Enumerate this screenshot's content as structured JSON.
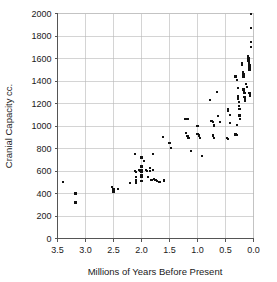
{
  "chart_data": {
    "type": "scatter",
    "title": "",
    "xlabel": "Millions of Years Before Present",
    "ylabel": "Cranial Capacity cc.",
    "xlim": [
      3.5,
      0.0
    ],
    "ylim": [
      0,
      2000
    ],
    "x_reversed": true,
    "grid": true,
    "legend": null,
    "xticks": [
      "3.5",
      "3.0",
      "2.5",
      "2.0",
      "1.5",
      "1.0",
      "0.5",
      "0.0"
    ],
    "xtick_values": [
      3.5,
      3.0,
      2.5,
      2.0,
      1.5,
      1.0,
      0.5,
      0.0
    ],
    "yticks": [
      "0",
      "200",
      "400",
      "600",
      "800",
      "1000",
      "1200",
      "1400",
      "1600",
      "1800",
      "2000"
    ],
    "ytick_values": [
      0,
      200,
      400,
      600,
      800,
      1000,
      1200,
      1400,
      1600,
      1800,
      2000
    ],
    "marker": "square",
    "marker_color": "#111111",
    "marker_size_px": 2.2,
    "points": [
      [
        3.4,
        500
      ],
      [
        3.18,
        400
      ],
      [
        3.18,
        320
      ],
      [
        2.52,
        460
      ],
      [
        2.5,
        435
      ],
      [
        2.5,
        415
      ],
      [
        2.42,
        440
      ],
      [
        2.2,
        495
      ],
      [
        2.12,
        750
      ],
      [
        2.12,
        600
      ],
      [
        2.1,
        590
      ],
      [
        2.1,
        545
      ],
      [
        2.1,
        520
      ],
      [
        2.1,
        505
      ],
      [
        2.1,
        490
      ],
      [
        2.05,
        610
      ],
      [
        2.02,
        600
      ],
      [
        2.0,
        720
      ],
      [
        2.0,
        640
      ],
      [
        2.0,
        605
      ],
      [
        2.0,
        595
      ],
      [
        2.0,
        560
      ],
      [
        2.0,
        545
      ],
      [
        2.0,
        510
      ],
      [
        1.95,
        690
      ],
      [
        1.92,
        610
      ],
      [
        1.9,
        600
      ],
      [
        1.88,
        550
      ],
      [
        1.85,
        630
      ],
      [
        1.85,
        600
      ],
      [
        1.82,
        520
      ],
      [
        1.8,
        750
      ],
      [
        1.8,
        610
      ],
      [
        1.78,
        530
      ],
      [
        1.75,
        520
      ],
      [
        1.72,
        510
      ],
      [
        1.68,
        505
      ],
      [
        1.62,
        900
      ],
      [
        1.6,
        515
      ],
      [
        1.5,
        850
      ],
      [
        1.48,
        805
      ],
      [
        1.22,
        1065
      ],
      [
        1.18,
        1060
      ],
      [
        1.2,
        940
      ],
      [
        1.18,
        910
      ],
      [
        1.16,
        895
      ],
      [
        1.15,
        890
      ],
      [
        1.12,
        780
      ],
      [
        1.0,
        1000
      ],
      [
        1.0,
        930
      ],
      [
        0.98,
        920
      ],
      [
        0.97,
        915
      ],
      [
        0.95,
        890
      ],
      [
        0.92,
        735
      ],
      [
        0.78,
        1230
      ],
      [
        0.75,
        1045
      ],
      [
        0.72,
        1035
      ],
      [
        0.7,
        1010
      ],
      [
        0.7,
        1000
      ],
      [
        0.72,
        915
      ],
      [
        0.7,
        890
      ],
      [
        0.65,
        1305
      ],
      [
        0.63,
        1090
      ],
      [
        0.6,
        1035
      ],
      [
        0.45,
        1150
      ],
      [
        0.45,
        1130
      ],
      [
        0.42,
        1100
      ],
      [
        0.42,
        1030
      ],
      [
        0.48,
        890
      ],
      [
        0.45,
        885
      ],
      [
        0.32,
        1440
      ],
      [
        0.3,
        1410
      ],
      [
        0.28,
        1340
      ],
      [
        0.28,
        1270
      ],
      [
        0.28,
        1250
      ],
      [
        0.27,
        1240
      ],
      [
        0.26,
        1215
      ],
      [
        0.26,
        1180
      ],
      [
        0.25,
        1150
      ],
      [
        0.25,
        1100
      ],
      [
        0.25,
        1090
      ],
      [
        0.24,
        1060
      ],
      [
        0.3,
        1010
      ],
      [
        0.32,
        925
      ],
      [
        0.3,
        920
      ],
      [
        0.2,
        1560
      ],
      [
        0.2,
        1540
      ],
      [
        0.19,
        1480
      ],
      [
        0.18,
        1460
      ],
      [
        0.18,
        1440
      ],
      [
        0.18,
        1330
      ],
      [
        0.18,
        1320
      ],
      [
        0.17,
        1300
      ],
      [
        0.16,
        1290
      ],
      [
        0.16,
        1260
      ],
      [
        0.15,
        1240
      ],
      [
        0.15,
        1225
      ],
      [
        0.14,
        1370
      ],
      [
        0.12,
        1350
      ],
      [
        0.1,
        1620
      ],
      [
        0.09,
        1600
      ],
      [
        0.09,
        1580
      ],
      [
        0.08,
        1570
      ],
      [
        0.08,
        1560
      ],
      [
        0.08,
        1550
      ],
      [
        0.07,
        1540
      ],
      [
        0.07,
        1520
      ],
      [
        0.07,
        1500
      ],
      [
        0.07,
        1290
      ],
      [
        0.06,
        1280
      ],
      [
        0.06,
        1270
      ],
      [
        0.05,
        1745
      ],
      [
        0.05,
        1700
      ],
      [
        0.05,
        1870
      ],
      [
        0.05,
        1995
      ]
    ]
  },
  "axes": {
    "x_title": "Millions of Years Before Present",
    "y_title": "Cranial Capacity cc."
  }
}
